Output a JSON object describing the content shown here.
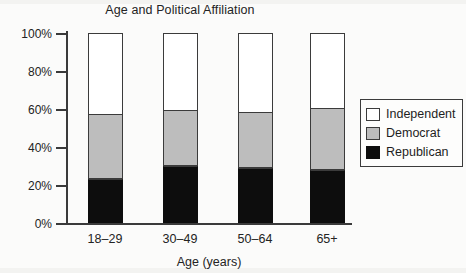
{
  "chart_data": {
    "type": "bar",
    "subtype": "stacked-percent",
    "title": "Age and Political Affiliation",
    "xlabel": "Age (years)",
    "ylabel": "",
    "categories": [
      "18–29",
      "30–49",
      "50–64",
      "65+"
    ],
    "series": [
      {
        "name": "Republican",
        "values": [
          23,
          30,
          29,
          28
        ],
        "color": "#0d0d0d"
      },
      {
        "name": "Democrat",
        "values": [
          34,
          29,
          29,
          32
        ],
        "color": "#bdbdbd"
      },
      {
        "name": "Independent",
        "values": [
          43,
          41,
          42,
          40
        ],
        "color": "#ffffff"
      }
    ],
    "stack_order_bottom_to_top": [
      "Republican",
      "Democrat",
      "Independent"
    ],
    "cumulative_tops": {
      "Republican": [
        23,
        30,
        29,
        28
      ],
      "Democrat": [
        57,
        59,
        58,
        60
      ],
      "Independent": [
        100,
        100,
        100,
        100
      ]
    },
    "ylim": [
      0,
      100
    ],
    "ytick_values": [
      0,
      20,
      40,
      60,
      80,
      100
    ],
    "ytick_labels": [
      "0%",
      "20%",
      "40%",
      "60%",
      "80%",
      "100%"
    ],
    "grid": false,
    "legend_position": "right"
  },
  "legend": {
    "items": [
      {
        "label": "Independent",
        "swatch": "white-square-swatch"
      },
      {
        "label": "Democrat",
        "swatch": "gray-square-swatch"
      },
      {
        "label": "Republican",
        "swatch": "black-square-swatch"
      }
    ]
  },
  "colors": {
    "republican": "#0d0d0d",
    "democrat": "#bdbdbd",
    "independent": "#ffffff",
    "axis": "#3a3a3a",
    "text": "#232323",
    "background": "#fbfbfa"
  }
}
